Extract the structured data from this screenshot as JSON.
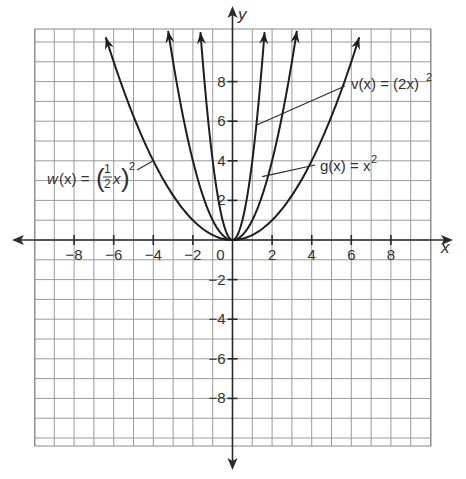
{
  "chart_data": {
    "type": "line",
    "title": "",
    "xlabel": "x",
    "ylabel": "y",
    "xlim": [
      -10,
      10
    ],
    "ylim": [
      -10,
      10
    ],
    "grid": true,
    "grid_step": 1,
    "x_ticks": [
      -8,
      -6,
      -4,
      -2,
      0,
      2,
      4,
      6,
      8
    ],
    "y_ticks": [
      -8,
      -6,
      -4,
      -2,
      2,
      4,
      6,
      8
    ],
    "x_tick_labels": [
      "−8",
      "−6",
      "−4",
      "−2",
      "0",
      "2",
      "4",
      "6",
      "8"
    ],
    "y_tick_labels": [
      "−8",
      "−6",
      "−4",
      "−2",
      "2",
      "4",
      "6",
      "8"
    ],
    "series": [
      {
        "name": "w(x) = (1/2 x)^2",
        "formula": "(0.5*x)^2",
        "label": "w(x) = (½x)²",
        "x_range": [
          -6.4,
          6.4
        ]
      },
      {
        "name": "g(x) = x^2",
        "formula": "x^2",
        "label": "g(x) = x²",
        "x_range": [
          -3.25,
          3.25
        ]
      },
      {
        "name": "v(x) = (2x)^2",
        "formula": "(2x)^2",
        "label": "v(x) = (2x)²",
        "x_range": [
          -1.62,
          1.62
        ]
      }
    ],
    "annotations": [
      {
        "text": "w(x) = (1/2 x)^2",
        "points_to": [
          -4,
          4
        ]
      },
      {
        "text": "v(x) = (2x)^2",
        "points_to": [
          1.2,
          5.8
        ]
      },
      {
        "text": "g(x) = x^2",
        "points_to": [
          1.5,
          3.3
        ]
      }
    ]
  },
  "labels": {
    "x_axis": "x",
    "y_axis": "y",
    "origin": "0",
    "w": {
      "fn": "w",
      "paren": "(x) = ",
      "num": "1",
      "den": "2",
      "var": "x",
      "exp": "2"
    },
    "v": {
      "text": "v(x) = (2x)",
      "exp": "2"
    },
    "g": {
      "text": "g(x) = x",
      "exp": "2"
    }
  }
}
